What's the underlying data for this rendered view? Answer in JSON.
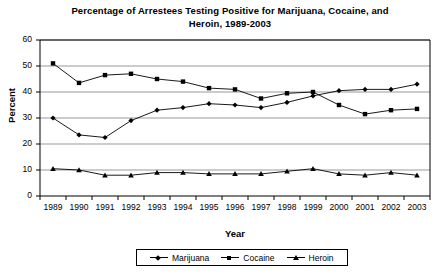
{
  "chart_data": {
    "type": "line",
    "title": "Percentage of Arrestees Testing Positive for Marijuana, Cocaine, and Heroin, 1989-2003",
    "title_line1": "Percentage of Arrestees Testing Positive for Marijuana, Cocaine, and",
    "title_line2": "Heroin, 1989-2003",
    "xlabel": "Year",
    "ylabel": "Percent",
    "categories": [
      "1989",
      "1990",
      "1991",
      "1992",
      "1993",
      "1994",
      "1995",
      "1996",
      "1997",
      "1998",
      "1999",
      "2000",
      "2001",
      "2002",
      "2003"
    ],
    "ylim": [
      0,
      60
    ],
    "yticks": [
      "0",
      "10",
      "20",
      "30",
      "40",
      "50",
      "60"
    ],
    "grid": true,
    "legend_position": "bottom",
    "series": [
      {
        "name": "Marijuana",
        "marker": "diamond",
        "values": [
          30,
          23.5,
          22.5,
          29,
          33,
          34,
          35.5,
          35,
          34,
          36,
          38.5,
          40.5,
          41,
          41,
          43
        ]
      },
      {
        "name": "Cocaine",
        "marker": "square",
        "values": [
          51,
          43.5,
          46.5,
          47,
          45,
          44,
          41.5,
          41,
          37.5,
          39.5,
          40,
          35,
          31.5,
          33,
          33.5
        ]
      },
      {
        "name": "Heroin",
        "marker": "triangle",
        "values": [
          10.5,
          10,
          8,
          8,
          9,
          9,
          8.5,
          8.5,
          8.5,
          9.5,
          10.5,
          8.5,
          8,
          9,
          8
        ]
      }
    ]
  },
  "legend": {
    "items": [
      {
        "label": "Marijuana"
      },
      {
        "label": "Cocaine"
      },
      {
        "label": "Heroin"
      }
    ]
  },
  "colors": {
    "series": "#000000",
    "grid": "#999999",
    "axis": "#000000",
    "background": "#ffffff"
  }
}
